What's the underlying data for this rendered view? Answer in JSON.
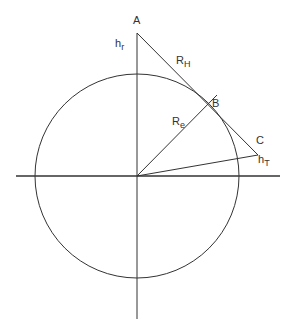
{
  "diagram": {
    "title": "",
    "colors": {
      "stroke": "#333333",
      "background": "#ffffff"
    },
    "labels": {
      "A": "A",
      "B": "B",
      "C": "C",
      "hr_main": "h",
      "hr_sub": "r",
      "RH_main": "R",
      "RH_sub": "H",
      "Re_main": "R",
      "Re_sub": "e",
      "hT_main": "h",
      "hT_sub": "T"
    }
  }
}
